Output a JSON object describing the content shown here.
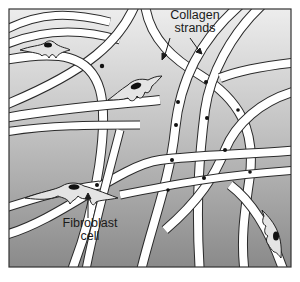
{
  "diagram": {
    "type": "illustration",
    "frame": {
      "x": 9,
      "y": 9,
      "width": 282,
      "height": 258,
      "border_color": "#333333"
    },
    "colors": {
      "background_top": "#ececec",
      "background_bottom": "#8c8c8c",
      "strand_fill": "#ffffff",
      "strand_outline": "#2a2a2a",
      "cell_fill": "#e4e4e4",
      "nucleus": "#111111",
      "label_text": "#1a1a1a"
    },
    "labels": {
      "collagen": {
        "line1": "Collagen",
        "line2": "strands"
      },
      "fibroblast": {
        "line1": "Fibroblast",
        "line2": "cell"
      }
    },
    "elements": [
      {
        "name": "collagen-strand",
        "count": 14
      },
      {
        "name": "fibroblast-cell",
        "count": 4
      }
    ]
  }
}
